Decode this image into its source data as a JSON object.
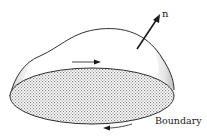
{
  "diagram": {
    "normal_label": "n",
    "boundary_label": "Boundary",
    "colors": {
      "stroke": "#1a1a1a",
      "dome_shade": "#d9d9d9",
      "base_hatch": "#9a9a9a",
      "background": "#ffffff"
    }
  }
}
